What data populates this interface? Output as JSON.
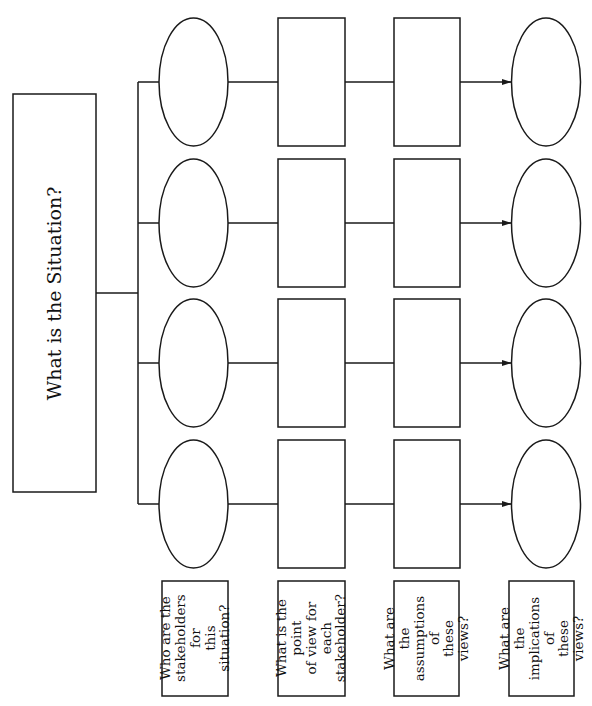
{
  "main": {
    "title": "What is the Situation?"
  },
  "columns": [
    {
      "shape": "ellipse",
      "label": "Who are the\nstakeholders for\nthis situation?"
    },
    {
      "shape": "rect",
      "label": "What is the point\nof view for each\nstakeholder?"
    },
    {
      "shape": "rect",
      "label": "What are the\nassumptions of\nthese views?"
    },
    {
      "shape": "ellipse",
      "label": "What are the\nimplications of\nthese views?"
    }
  ],
  "rows": 4,
  "colors": {
    "stroke": "#1a1a1a",
    "background": "#ffffff"
  }
}
